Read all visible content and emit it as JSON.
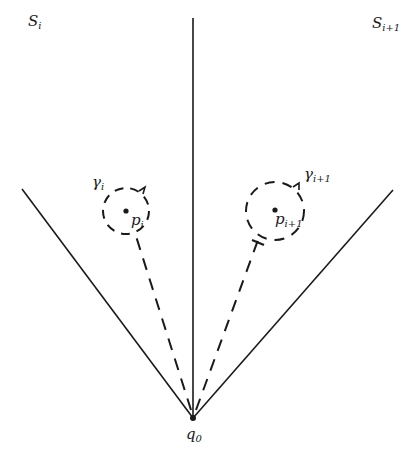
{
  "diagram": {
    "labels": {
      "sector_left": {
        "base": "S",
        "sub": "i"
      },
      "sector_right": {
        "base": "S",
        "sub": "i+1"
      },
      "loop_left": {
        "base": "γ",
        "sub": "i"
      },
      "loop_right": {
        "base": "γ",
        "sub": "i+1"
      },
      "point_left": {
        "base": "p",
        "sub": "i"
      },
      "point_right": {
        "base": "p",
        "sub": "i+1"
      },
      "origin": {
        "base": "q",
        "sub": "0"
      }
    },
    "geometry": {
      "apex": [
        193,
        418
      ],
      "left_ray_end": [
        22,
        189
      ],
      "center_ray_end": [
        193,
        18
      ],
      "right_ray_end": [
        393,
        190
      ],
      "left_circle": {
        "cx": 126,
        "cy": 211,
        "r": 23
      },
      "right_circle": {
        "cx": 275,
        "cy": 211,
        "r": 29
      }
    },
    "colors": {
      "stroke": "#1a1a1a"
    }
  }
}
